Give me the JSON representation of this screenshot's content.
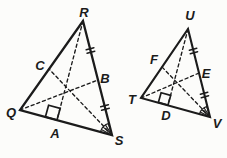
{
  "background_color": "#fcfcfa",
  "line_color": "#1b1b1b",
  "triangle1": {
    "vertex_top": "R",
    "vertex_bottom_left": "Q",
    "vertex_bottom_right": "S",
    "point_left_side": "C",
    "point_right_side": "B",
    "point_bottom_side": "A"
  },
  "triangle2": {
    "vertex_top": "U",
    "vertex_bottom_left": "T",
    "vertex_bottom_right": "V",
    "point_left_side": "F",
    "point_right_side": "E",
    "point_bottom_side": "D"
  }
}
